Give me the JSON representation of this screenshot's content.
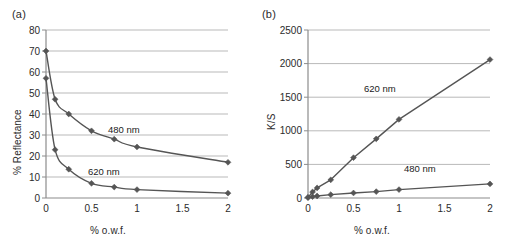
{
  "figure": {
    "panel_a_label": "(a)",
    "panel_b_label": "(b)"
  },
  "chart_data": [
    {
      "id": "panel-a",
      "panel": "(a)",
      "type": "line",
      "title": "",
      "xlabel": "% o.w.f.",
      "ylabel": "% Reflectance",
      "xlim": [
        0,
        2
      ],
      "ylim": [
        0,
        80
      ],
      "xticks": [
        0,
        0.5,
        1,
        1.5,
        2
      ],
      "xticklabels": [
        "0",
        "0.5",
        "1",
        "1.5",
        "2"
      ],
      "yticks": [
        0,
        10,
        20,
        30,
        40,
        50,
        60,
        70,
        80
      ],
      "yticklabels": [
        "0",
        "10",
        "20",
        "30",
        "40",
        "50",
        "60",
        "70",
        "80"
      ],
      "grid": "horizontal",
      "legend_position": "inline-annotation",
      "series": [
        {
          "name": "480 nm",
          "label": "480 nm",
          "color": "#555555",
          "marker": "diamond",
          "x": [
            0,
            0.1,
            0.25,
            0.5,
            0.75,
            1,
            2
          ],
          "values": [
            70,
            47,
            40,
            32,
            28,
            24.3,
            17
          ]
        },
        {
          "name": "620 nm",
          "label": "620 nm",
          "color": "#555555",
          "marker": "diamond",
          "x": [
            0,
            0.1,
            0.25,
            0.5,
            0.75,
            1,
            2
          ],
          "values": [
            57,
            23,
            13.7,
            7,
            5.2,
            4,
            2.3
          ]
        }
      ]
    },
    {
      "id": "panel-b",
      "panel": "(b)",
      "type": "line",
      "title": "",
      "xlabel": "% o.w.f.",
      "ylabel": "K/S",
      "xlim": [
        0,
        2
      ],
      "ylim": [
        0,
        2500
      ],
      "xticks": [
        0,
        0.5,
        1,
        1.5,
        2
      ],
      "xticklabels": [
        "0",
        "0.5",
        "1",
        "1.5",
        "2"
      ],
      "yticks": [
        0,
        500,
        1000,
        1500,
        2000,
        2500
      ],
      "yticklabels": [
        "0",
        "500",
        "1000",
        "1500",
        "2000",
        "2500"
      ],
      "grid": "horizontal",
      "legend_position": "inline-annotation",
      "series": [
        {
          "name": "620 nm",
          "label": "620 nm",
          "color": "#555555",
          "marker": "diamond",
          "x": [
            0,
            0.05,
            0.1,
            0.25,
            0.5,
            0.75,
            1,
            2
          ],
          "values": [
            10,
            90,
            150,
            270,
            600,
            880,
            1170,
            2060
          ]
        },
        {
          "name": "480 nm",
          "label": "480 nm",
          "color": "#555555",
          "marker": "diamond",
          "x": [
            0,
            0.05,
            0.1,
            0.25,
            0.5,
            0.75,
            1,
            2
          ],
          "values": [
            5,
            20,
            30,
            50,
            75,
            95,
            125,
            210
          ]
        }
      ]
    }
  ]
}
